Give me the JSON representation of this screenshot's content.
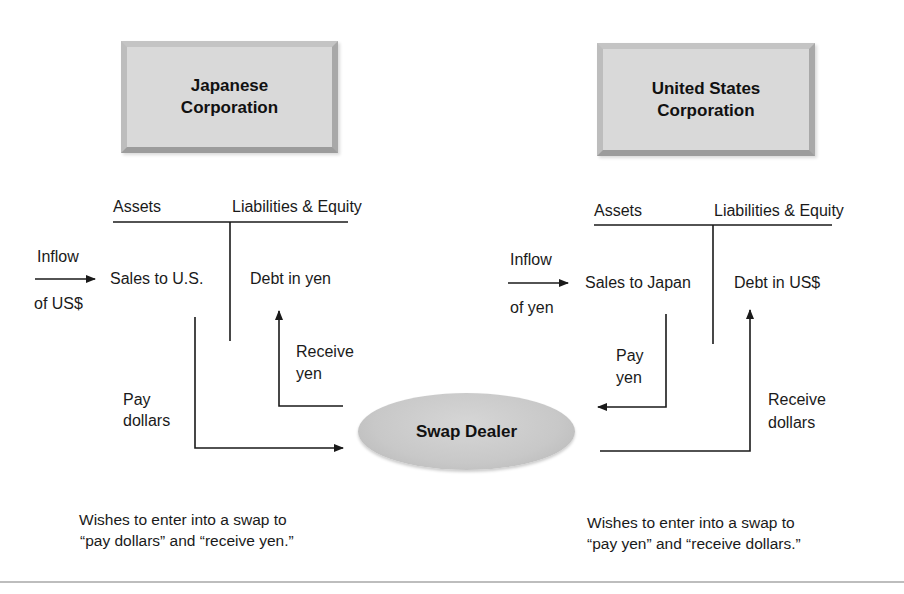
{
  "diagram": {
    "type": "currency-swap-flow",
    "japanese_corporation": {
      "title_line1": "Japanese",
      "title_line2": "Corporation",
      "ledger": {
        "assets_header": "Assets",
        "liabilities_header": "Liabilities & Equity",
        "asset_entry": "Sales to U.S.",
        "liability_entry": "Debt in yen"
      },
      "inflow_label_top": "Inflow",
      "inflow_label_bottom": "of US$",
      "pay_label_line1": "Pay",
      "pay_label_line2": "dollars",
      "receive_label_line1": "Receive",
      "receive_label_line2": "yen",
      "note_line1": "Wishes to enter into a swap to",
      "note_line2": "“pay dollars” and “receive yen.”"
    },
    "us_corporation": {
      "title_line1": "United States",
      "title_line2": "Corporation",
      "ledger": {
        "assets_header": "Assets",
        "liabilities_header": "Liabilities & Equity",
        "asset_entry": "Sales to Japan",
        "liability_entry": "Debt in US$"
      },
      "inflow_label_top": "Inflow",
      "inflow_label_bottom": "of yen",
      "pay_label_line1": "Pay",
      "pay_label_line2": "yen",
      "receive_label_line1": "Receive",
      "receive_label_line2": "dollars",
      "note_line1": "Wishes to enter into a swap to",
      "note_line2": "“pay yen” and “receive dollars.”"
    },
    "swap_dealer": {
      "label": "Swap Dealer"
    },
    "colors": {
      "box_fill": "#d9d9d9",
      "ellipse_fill": "#c8c8c8",
      "line": "#1a1a1a",
      "divider": "#bdbdbd"
    }
  }
}
